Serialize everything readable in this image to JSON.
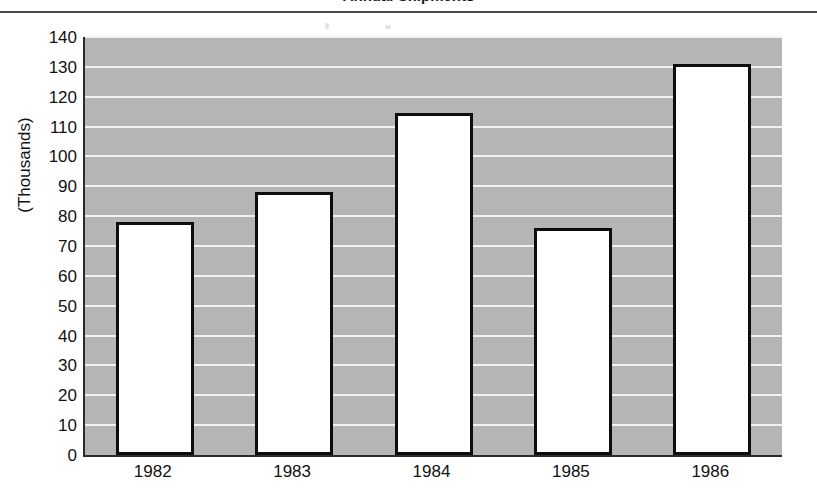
{
  "chart_data": {
    "type": "bar",
    "title": "",
    "xlabel": "",
    "ylabel": "(Thousands)",
    "categories": [
      "1982",
      "1983",
      "1984",
      "1985",
      "1986"
    ],
    "values": [
      78,
      88,
      114.5,
      76,
      131
    ],
    "ylim": [
      0,
      140
    ],
    "ytick_step": 10,
    "yticks": [
      "140",
      "130",
      "120",
      "110",
      "100",
      "90",
      "80",
      "70",
      "60",
      "50",
      "40",
      "30",
      "20",
      "10",
      "0"
    ],
    "grid": true,
    "grid_axis": "y",
    "legend": "none",
    "bar_fill": "#ffffff",
    "bar_edge": "#0d0d0d",
    "plot_background": "#b5b5b5",
    "gridline_color": "#f2f2f2"
  },
  "figure": {
    "title_clipped": "Annual Shipments",
    "top_rule_color": "#4a4a4a"
  }
}
